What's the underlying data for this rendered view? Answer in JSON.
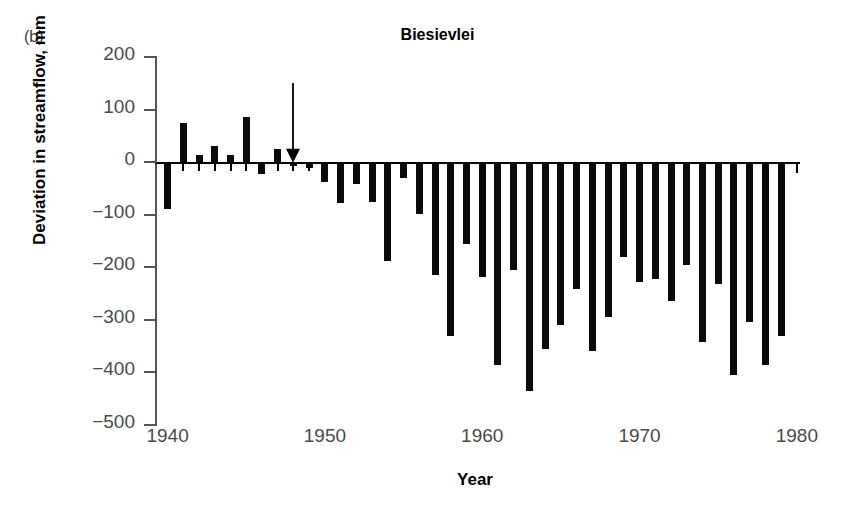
{
  "panel_label": "(b)",
  "chart_data": {
    "type": "bar",
    "title": "Biesievlei",
    "xlabel": "Year",
    "ylabel": "Deviation in streamflow, mm",
    "xlim": [
      1939.2,
      1980.2
    ],
    "ylim": [
      -500,
      200
    ],
    "yticks": [
      200,
      100,
      0,
      -100,
      -200,
      -300,
      -400,
      -500
    ],
    "ytick_labels": [
      "200",
      "100",
      "0",
      "−100",
      "−200",
      "−300",
      "−400",
      "−500"
    ],
    "xticks": [
      1940,
      1950,
      1960,
      1970,
      1980
    ],
    "xtick_labels": [
      "1940",
      "1950",
      "1960",
      "1970",
      "1980"
    ],
    "grid": false,
    "legend": null,
    "bar_color": "#0a0a0a",
    "categories": [
      1940,
      1941,
      1942,
      1943,
      1944,
      1945,
      1946,
      1947,
      1948,
      1949,
      1950,
      1951,
      1952,
      1953,
      1954,
      1955,
      1956,
      1957,
      1958,
      1959,
      1960,
      1961,
      1962,
      1963,
      1964,
      1965,
      1966,
      1967,
      1968,
      1969,
      1970,
      1971,
      1972,
      1973,
      1974,
      1975,
      1976,
      1977,
      1978,
      1979
    ],
    "values": [
      -90,
      74,
      14,
      30,
      13,
      85,
      -22,
      25,
      -8,
      -12,
      -38,
      -78,
      -42,
      -75,
      -188,
      -30,
      -98,
      -215,
      -330,
      -155,
      -218,
      -385,
      -205,
      -435,
      -355,
      -310,
      -242,
      -360,
      -295,
      -180,
      -228,
      -222,
      -265,
      -195,
      -342,
      -232,
      -405,
      -305,
      -385,
      -330
    ],
    "annotations": [
      {
        "type": "arrow",
        "x": 1948,
        "label": "",
        "y_from": 150,
        "y_to": 0,
        "direction": "down",
        "color": "#000000"
      }
    ]
  }
}
